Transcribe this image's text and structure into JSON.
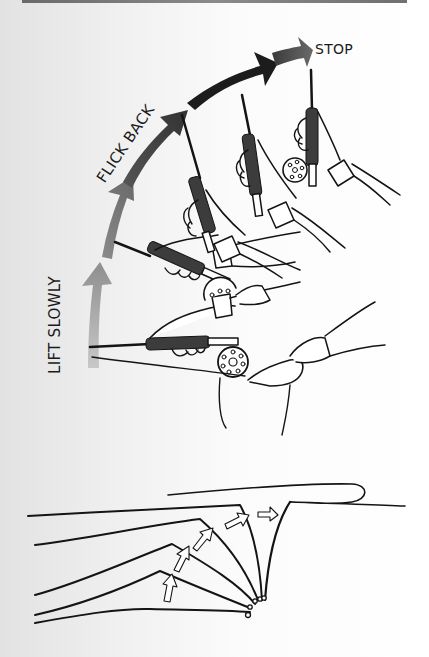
{
  "figure": {
    "labels": {
      "stop": "STOP",
      "flick_back": "FLICK BACK",
      "lift_slowly": "LIFT SLOWLY"
    },
    "top_illustration": {
      "description": "Four positions of a fly rod held in hand, rising from horizontal to near-vertical, with a curved arrow in segments of increasing darkness",
      "arrow_segments": [
        {
          "phase": "lift_slowly",
          "color": "#9a9a9a"
        },
        {
          "phase": "lift_slowly",
          "color": "#7a7a7a"
        },
        {
          "phase": "flick_back",
          "color": "#4a4a4a"
        },
        {
          "phase": "flick_back",
          "color": "#1c1c1c"
        },
        {
          "phase": "stop",
          "color": "#555555"
        }
      ],
      "rod_positions": 4
    },
    "bottom_illustration": {
      "description": "Line diagram of rod tip positions bending progressively with outline arrows showing line motion, ending in a loop",
      "rod_curves": 6,
      "motion_arrows": 5
    }
  },
  "colors": {
    "ink": "#141414",
    "top_bar": "#7a7a7a"
  }
}
